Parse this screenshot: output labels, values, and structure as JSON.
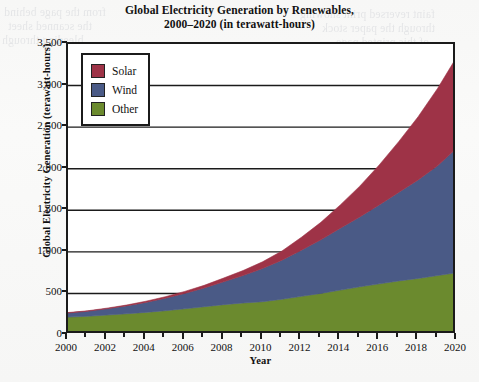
{
  "title": {
    "line1": "Global Electricity Generation by Renewables,",
    "line2": "2000–2020 (in terawatt-hours)"
  },
  "axes": {
    "y_title": "Global Electricity Generation (terawatt-hours)",
    "x_title": "Year",
    "y_ticks": [
      "0",
      "500",
      "1,000",
      "1,500",
      "2,000",
      "2,500",
      "3,000",
      "3,500"
    ],
    "x_ticks": [
      "2000",
      "2002",
      "2004",
      "2006",
      "2008",
      "2010",
      "2012",
      "2014",
      "2016",
      "2018",
      "2020"
    ]
  },
  "legend": {
    "items": [
      {
        "label": "Solar",
        "color": "#9E3347"
      },
      {
        "label": "Wind",
        "color": "#4A5A86"
      },
      {
        "label": "Other",
        "color": "#6B8A2E"
      }
    ]
  },
  "ghost_text": [
    {
      "text": "from the page behind",
      "x": 4,
      "y": 6
    },
    {
      "text": "the scanned sheet",
      "x": 8,
      "y": 20
    },
    {
      "text": "bleeding through",
      "x": 2,
      "y": 34
    },
    {
      "text": "faint reversed print showing",
      "x": 300,
      "y": 8
    },
    {
      "text": "through the paper stock",
      "x": 322,
      "y": 22
    },
    {
      "text": "of this printed page",
      "x": 336,
      "y": 36
    },
    {
      "text": "indistinct offset text",
      "x": 196,
      "y": 62
    },
    {
      "text": "partly legible words",
      "x": 214,
      "y": 84
    },
    {
      "text": "ghosted impression",
      "x": 206,
      "y": 106
    },
    {
      "text": "residual ink shadow",
      "x": 228,
      "y": 128
    }
  ],
  "chart_data": {
    "type": "area",
    "stacked": true,
    "title": "Global Electricity Generation by Renewables, 2000–2020 (in terawatt-hours)",
    "xlabel": "Year",
    "ylabel": "Global Electricity Generation (terawatt-hours)",
    "xlim": [
      2000,
      2020
    ],
    "ylim": [
      0,
      3500
    ],
    "grid": "horizontal",
    "legend_position": "top-left-inside",
    "x": [
      2000,
      2001,
      2002,
      2003,
      2004,
      2005,
      2006,
      2007,
      2008,
      2009,
      2010,
      2011,
      2012,
      2013,
      2014,
      2015,
      2016,
      2017,
      2018,
      2019,
      2020
    ],
    "series": [
      {
        "name": "Other",
        "color": "#6B8A2E",
        "values": [
          215,
          225,
          240,
          255,
          272,
          292,
          315,
          340,
          365,
          385,
          400,
          430,
          465,
          500,
          540,
          580,
          615,
          650,
          680,
          715,
          750
        ]
      },
      {
        "name": "Wind",
        "color": "#4A5A86",
        "values": [
          50,
          60,
          75,
          95,
          120,
          150,
          185,
          225,
          275,
          330,
          400,
          470,
          555,
          645,
          745,
          840,
          950,
          1065,
          1185,
          1320,
          1500
        ]
      },
      {
        "name": "Solar",
        "color": "#9E3347",
        "values": [
          5,
          6,
          8,
          10,
          14,
          18,
          24,
          32,
          45,
          60,
          80,
          110,
          155,
          210,
          280,
          370,
          480,
          610,
          760,
          930,
          1100
        ]
      }
    ],
    "cumulative_totals": [
      270,
      291,
      323,
      360,
      406,
      460,
      524,
      597,
      685,
      775,
      880,
      1010,
      1175,
      1355,
      1565,
      1790,
      2045,
      2325,
      2625,
      2965,
      3350
    ]
  }
}
